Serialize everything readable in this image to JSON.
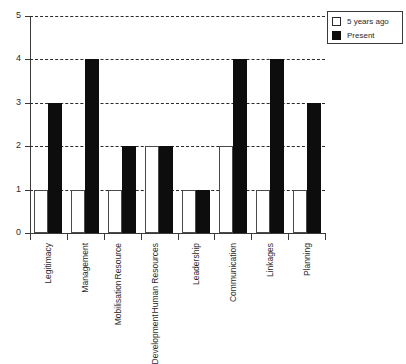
{
  "chart_data": {
    "type": "bar",
    "title": "",
    "xlabel": "",
    "ylabel": "",
    "ylim": [
      0,
      5
    ],
    "yticks": [
      0,
      1,
      2,
      3,
      4,
      5
    ],
    "grid": true,
    "grid_style": "dashed-horizontal",
    "legend_position": "top-right",
    "categories": [
      "Legitimacy",
      "Resource Mobilisation",
      "Management",
      "Human Resources Development",
      "Leadership",
      "Communication",
      "Linkages",
      "Planning"
    ],
    "category_lines": [
      [
        "Legitimacy"
      ],
      [
        "Management"
      ],
      [
        "Resource",
        "Mobilisation"
      ],
      [
        "Human Resources",
        "Development"
      ],
      [
        "Leadership"
      ],
      [
        "Communication"
      ],
      [
        "Linkages"
      ],
      [
        "Planning"
      ]
    ],
    "categories_ordered": [
      "Legitimacy",
      "Management",
      "Resource Mobilisation",
      "Human Resources Development",
      "Leadership",
      "Communication",
      "Linkages",
      "Planning"
    ],
    "series": [
      {
        "name": "5 years ago",
        "color": "#ffffff",
        "edge_color": "#4a4a4a",
        "values": [
          1,
          1,
          1,
          2,
          1,
          2,
          1,
          1
        ]
      },
      {
        "name": "Present",
        "color": "#0d0d0d",
        "edge_color": "#0d0d0d",
        "values": [
          3,
          4,
          2,
          2,
          1,
          4,
          4,
          3
        ]
      }
    ]
  },
  "legend": {
    "items": [
      {
        "label": "5 years ago",
        "style": "past"
      },
      {
        "label": "Present",
        "style": "present"
      }
    ]
  },
  "axis": {
    "y_tick_labels": [
      "0",
      "1",
      "2",
      "3",
      "4",
      "5"
    ]
  },
  "colors": {
    "background": "#ffffff",
    "axis": "#3a3a3a",
    "grid": "#2b2b2b",
    "bar_past": "#ffffff",
    "bar_present": "#0d0d0d",
    "text": "#2b2b2b"
  }
}
